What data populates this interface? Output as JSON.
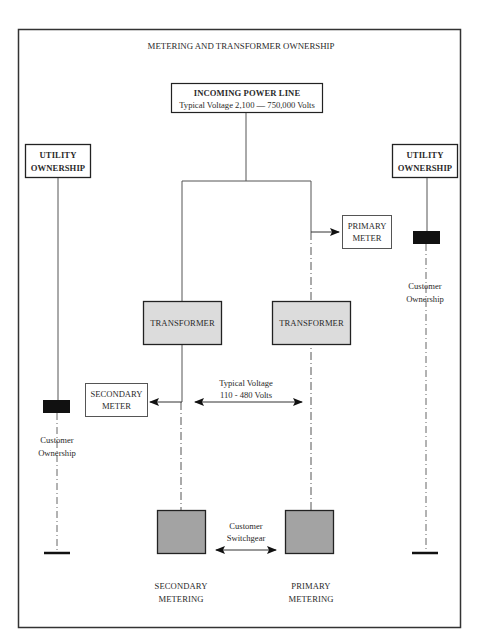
{
  "title": "METERING AND TRANSFORMER OWNERSHIP",
  "incoming": {
    "label": "INCOMING POWER LINE",
    "voltage": "Typical Voltage  2,100 — 750,000 Volts"
  },
  "utility_left": {
    "line1": "UTILITY",
    "line2": "OWNERSHIP"
  },
  "utility_right": {
    "line1": "UTILITY",
    "line2": "OWNERSHIP"
  },
  "primary_meter": {
    "line1": "PRIMARY",
    "line2": "METER"
  },
  "secondary_meter": {
    "line1": "SECONDARY",
    "line2": "METER"
  },
  "transformer_left": {
    "label": "TRANSFORMER"
  },
  "transformer_right": {
    "label": "TRANSFORMER"
  },
  "customer_ownership_left": {
    "line1": "Customer",
    "line2": "Ownership"
  },
  "customer_ownership_right": {
    "line1": "Customer",
    "line2": "Ownership"
  },
  "secondary_voltage": {
    "line1": "Typical Voltage",
    "line2": "110 - 480 Volts"
  },
  "switchgear": {
    "line1": "Customer",
    "line2": "Switchgear"
  },
  "bottom_left": {
    "line1": "SECONDARY",
    "line2": "METERING"
  },
  "bottom_right": {
    "line1": "PRIMARY",
    "line2": "METERING"
  },
  "colors": {
    "border": "#333333",
    "line": "#555555",
    "transformer_fill": "#dcdcdc",
    "switchgear_fill": "#a3a3a3",
    "meter_block": "#111111"
  }
}
